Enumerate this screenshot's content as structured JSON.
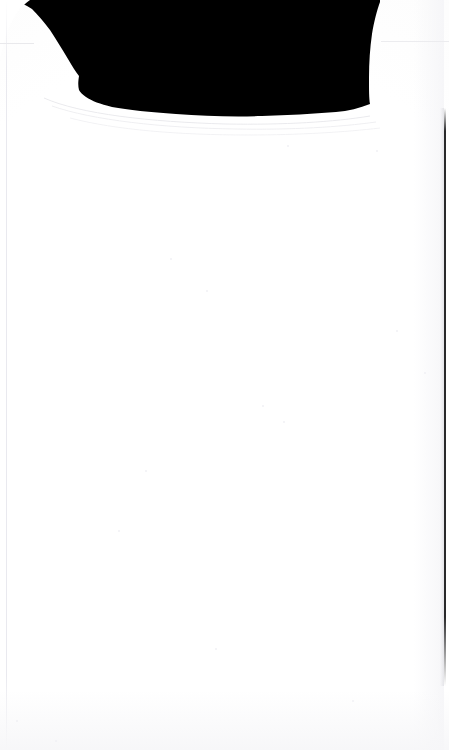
{
  "document": {
    "kind": "scanned-page",
    "page_body_text": "",
    "blank_caption": "",
    "background_color": "#ffffff",
    "paper_color": "#fefefe",
    "ink_color": "#000000"
  },
  "regions": {
    "dark_mask": {
      "name": "black-scan-mask",
      "fill": "#000000",
      "top": 0,
      "left": 12,
      "right": 380,
      "bottom": 118
    },
    "edge_halo": {
      "name": "scan-edge-halo",
      "color": "#d8d8de"
    }
  },
  "artifacts": {
    "rule_horizontal_left": {
      "color": "#e9e9ec",
      "y": 43
    },
    "rule_horizontal_right": {
      "color": "#ececef",
      "y": 41
    },
    "rule_vertical_left": {
      "color": "#e8e8ee",
      "x": 6
    },
    "rule_vertical_right": {
      "color": "#161618",
      "x": 444
    },
    "speckles": [
      {
        "x": 170,
        "y": 258,
        "r": 1
      },
      {
        "x": 287,
        "y": 145,
        "r": 1
      },
      {
        "x": 376,
        "y": 150,
        "r": 1
      },
      {
        "x": 206,
        "y": 290,
        "r": 1
      },
      {
        "x": 283,
        "y": 421,
        "r": 1
      },
      {
        "x": 396,
        "y": 330,
        "r": 1
      },
      {
        "x": 118,
        "y": 530,
        "r": 1
      },
      {
        "x": 262,
        "y": 405,
        "r": 1
      },
      {
        "x": 215,
        "y": 648,
        "r": 1
      },
      {
        "x": 16,
        "y": 720,
        "r": 1
      },
      {
        "x": 55,
        "y": 740,
        "r": 1
      },
      {
        "x": 424,
        "y": 372,
        "r": 1
      },
      {
        "x": 352,
        "y": 700,
        "r": 1
      },
      {
        "x": 145,
        "y": 470,
        "r": 1
      }
    ]
  }
}
